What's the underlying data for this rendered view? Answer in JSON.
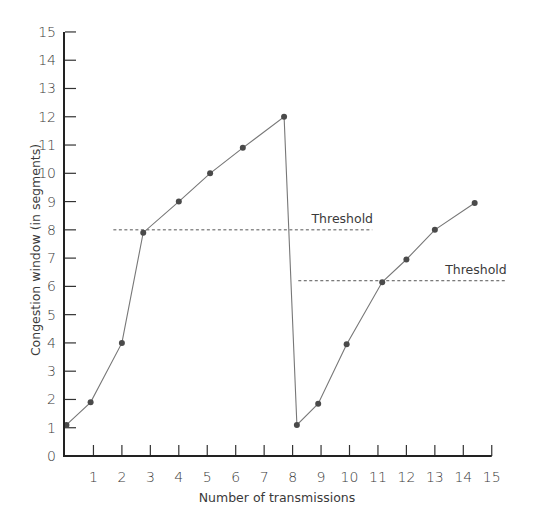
{
  "chart_data": {
    "type": "line",
    "title": "",
    "xlabel": "Number of transmissions",
    "ylabel": "Congestion window (in segments)",
    "xlim": [
      0,
      15
    ],
    "ylim": [
      0,
      15
    ],
    "grid": false,
    "legend": null,
    "x_ticks": [
      "1",
      "2",
      "3",
      "4",
      "5",
      "6",
      "7",
      "8",
      "9",
      "10",
      "11",
      "12",
      "13",
      "14",
      "15"
    ],
    "y_ticks": [
      "0",
      "1",
      "2",
      "3",
      "4",
      "5",
      "6",
      "7",
      "8",
      "9",
      "10",
      "11",
      "12",
      "13",
      "14",
      "15"
    ],
    "series": [
      {
        "name": "Congestion window",
        "points": [
          {
            "x": 0.05,
            "y": 1.1
          },
          {
            "x": 0.9,
            "y": 1.9
          },
          {
            "x": 2.0,
            "y": 4.0
          },
          {
            "x": 2.75,
            "y": 7.9
          },
          {
            "x": 4.0,
            "y": 9.0
          },
          {
            "x": 5.1,
            "y": 10.0
          },
          {
            "x": 6.25,
            "y": 10.9
          },
          {
            "x": 7.7,
            "y": 12.0
          },
          {
            "x": 8.15,
            "y": 1.1
          },
          {
            "x": 8.9,
            "y": 1.85
          },
          {
            "x": 9.9,
            "y": 3.95
          },
          {
            "x": 11.15,
            "y": 6.15
          },
          {
            "x": 12.0,
            "y": 6.95
          },
          {
            "x": 13.0,
            "y": 8.0
          },
          {
            "x": 14.4,
            "y": 8.95
          }
        ]
      }
    ],
    "annotations": [
      {
        "label": "Threshold",
        "y": 8.0,
        "x_start": 1.7,
        "x_end": 10.8
      },
      {
        "label": "Threshold",
        "y": 6.2,
        "x_start": 8.2,
        "x_end": 15.5
      }
    ]
  }
}
